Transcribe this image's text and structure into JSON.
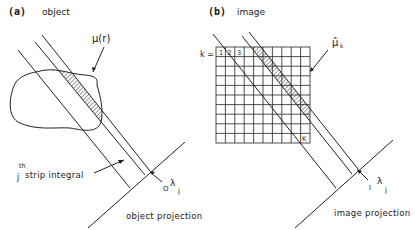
{
  "panel_a": {
    "tag": "(a)",
    "title": "object",
    "density_label": "μ(r)",
    "strip_label_sup": "th",
    "strip_label_j": "j",
    "strip_label": "strip integral",
    "projection_symbol_pre": "O",
    "projection_symbol": "λ",
    "projection_symbol_sub": "j",
    "projection_caption": "object projection"
  },
  "panel_b": {
    "tag": "(b)",
    "title": "image",
    "pixel_index_label": "k =",
    "cell_labels": [
      "1",
      "2",
      "3"
    ],
    "last_cell_label": "K",
    "grid_size": "10x10",
    "estimate_label": "μ̂",
    "estimate_sub": "k",
    "projection_symbol_pre": "I",
    "projection_symbol": "λ",
    "projection_symbol_sub": "j",
    "projection_caption": "image projection"
  }
}
